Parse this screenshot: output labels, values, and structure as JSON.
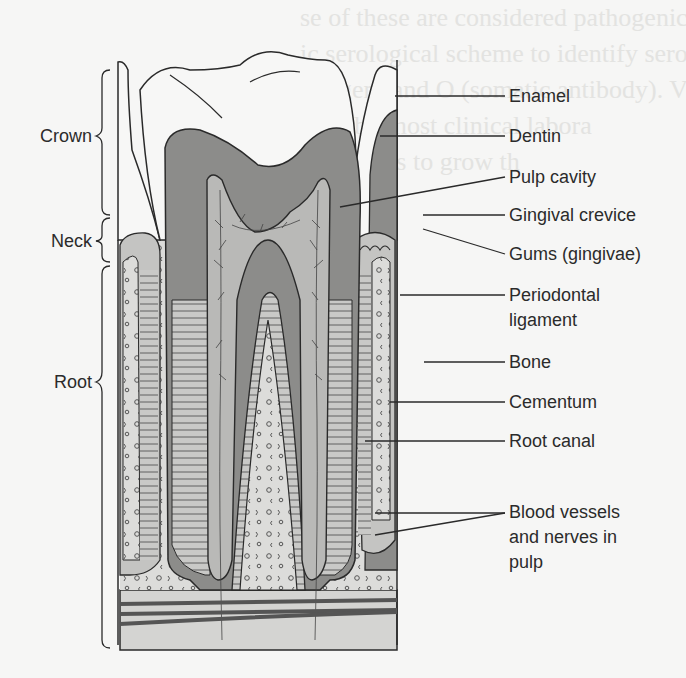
{
  "figure": {
    "colors": {
      "background": "#f6f6f5",
      "dentin": "#8c8c8a",
      "pulp": "#b9b9b7",
      "bone": "#dcdcda",
      "enamel": "#f7f7f6",
      "ligament": "#c4c4c2",
      "line": "#2a2a2a"
    },
    "right_labels": [
      {
        "id": "enamel",
        "text": "Enamel"
      },
      {
        "id": "dentin",
        "text": "Dentin"
      },
      {
        "id": "pulp-cavity",
        "text": "Pulp cavity"
      },
      {
        "id": "gingival-crevice",
        "text": "Gingival crevice"
      },
      {
        "id": "gums",
        "text": "Gums (gingivae)"
      },
      {
        "id": "periodontal-ligament",
        "text": "Periodontal ligament"
      },
      {
        "id": "bone",
        "text": "Bone"
      },
      {
        "id": "cementum",
        "text": "Cementum"
      },
      {
        "id": "root-canal",
        "text": "Root canal"
      },
      {
        "id": "blood-vessels",
        "text": "Blood vessels and nerves in pulp"
      }
    ],
    "left_brackets": [
      {
        "id": "crown",
        "text": "Crown"
      },
      {
        "id": "neck",
        "text": "Neck"
      },
      {
        "id": "root",
        "text": "Root"
      }
    ]
  },
  "bleed_through_text": [
    "se of these are considered pathogenic to some",
    "ic serological scheme to identify serovars a",
    "antigen) and O (somatic antibody). Vi",
    "used by most clinical labora",
    "organisms to grow th",
    "in 36 hou",
    "there is",
    "intestina",
    "frequen",
    "",
    "",
    "",
    "",
    "cause of",
    "are lev",
    "cond or",
    "etal, w",
    "characteri"
  ]
}
